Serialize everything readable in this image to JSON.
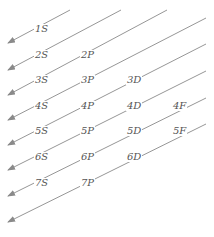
{
  "colors": {
    "line": "#8a8a8a",
    "text": "#555555"
  },
  "arrows": [
    {
      "x1": 70,
      "y1": 10,
      "x2": 8,
      "y2": 43
    },
    {
      "x1": 121,
      "y1": 10,
      "x2": 8,
      "y2": 70
    },
    {
      "x1": 167,
      "y1": 10,
      "x2": 8,
      "y2": 95
    },
    {
      "x1": 206,
      "y1": 18,
      "x2": 8,
      "y2": 120
    },
    {
      "x1": 206,
      "y1": 44,
      "x2": 8,
      "y2": 145
    },
    {
      "x1": 206,
      "y1": 71,
      "x2": 8,
      "y2": 170
    },
    {
      "x1": 206,
      "y1": 98,
      "x2": 8,
      "y2": 196
    },
    {
      "x1": 206,
      "y1": 124,
      "x2": 8,
      "y2": 222
    }
  ],
  "orbitals": [
    {
      "label": "1S",
      "x": 34,
      "y": 24
    },
    {
      "label": "2S",
      "x": 34,
      "y": 50
    },
    {
      "label": "2P",
      "x": 80,
      "y": 50
    },
    {
      "label": "3S",
      "x": 34,
      "y": 75
    },
    {
      "label": "3P",
      "x": 80,
      "y": 75
    },
    {
      "label": "3D",
      "x": 126,
      "y": 75
    },
    {
      "label": "4S",
      "x": 34,
      "y": 101
    },
    {
      "label": "4P",
      "x": 80,
      "y": 101
    },
    {
      "label": "4D",
      "x": 126,
      "y": 101
    },
    {
      "label": "4F",
      "x": 172,
      "y": 101
    },
    {
      "label": "5S",
      "x": 34,
      "y": 126
    },
    {
      "label": "5P",
      "x": 80,
      "y": 126
    },
    {
      "label": "5D",
      "x": 126,
      "y": 126
    },
    {
      "label": "5F",
      "x": 172,
      "y": 126
    },
    {
      "label": "6S",
      "x": 34,
      "y": 152
    },
    {
      "label": "6P",
      "x": 80,
      "y": 152
    },
    {
      "label": "6D",
      "x": 126,
      "y": 152
    },
    {
      "label": "7S",
      "x": 34,
      "y": 178
    },
    {
      "label": "7P",
      "x": 80,
      "y": 178
    }
  ]
}
